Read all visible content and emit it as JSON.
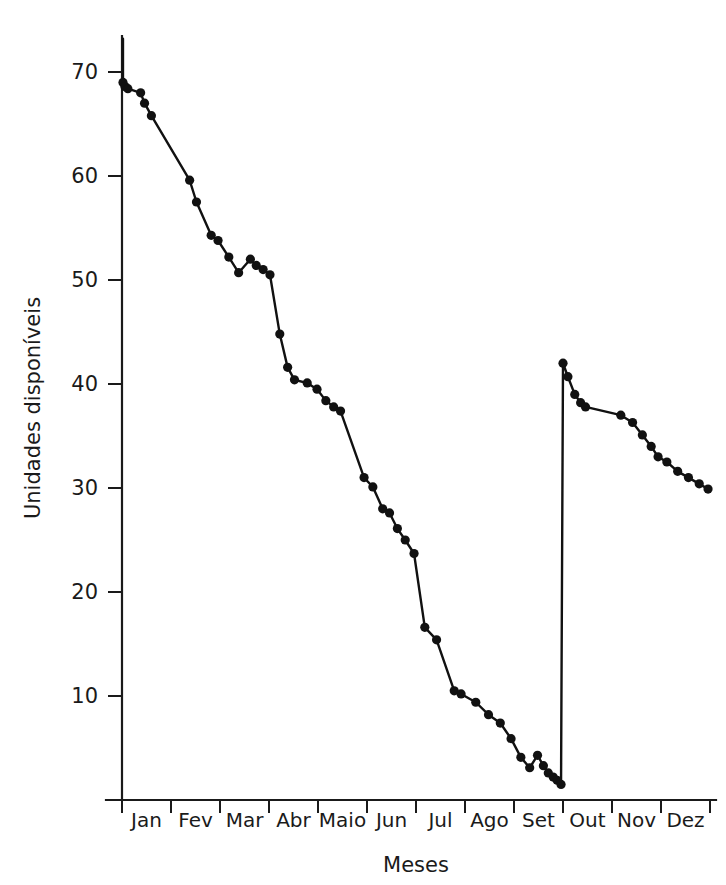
{
  "chart_data": {
    "type": "line",
    "title": "",
    "xlabel": "Meses",
    "ylabel": "Unidades disponíveis",
    "xtick_labels": [
      "Jan",
      "Fev",
      "Mar",
      "Abr",
      "Maio",
      "Jun",
      "Jul",
      "Ago",
      "Set",
      "Out",
      "Nov",
      "Dez"
    ],
    "ytick_labels": [
      "70",
      "60",
      "50",
      "40",
      "30",
      "20",
      "10"
    ],
    "ytick_values": [
      70,
      60,
      50,
      40,
      30,
      20,
      10
    ],
    "ylim": [
      0,
      73.5
    ],
    "xlim": [
      0,
      12
    ],
    "grid": false,
    "legend": "none",
    "marker": "filled-circle",
    "line_color": "#111111",
    "marker_color": "#111111",
    "background_color": "#ffffff",
    "annotations": [
      "Vertical restock jump at end of Set: value rises from about 1.5 to about 42",
      "Short vertical stub at start of Jan from about 73 down to about 69"
    ],
    "series": [
      {
        "name": "Unidades disponíveis",
        "x": [
          0.02,
          0.02,
          0.06,
          0.12,
          0.38,
          0.46,
          0.6,
          1.38,
          1.52,
          1.82,
          1.96,
          2.18,
          2.38,
          2.62,
          2.74,
          2.88,
          3.02,
          3.22,
          3.38,
          3.52,
          3.78,
          3.98,
          4.16,
          4.32,
          4.46,
          4.94,
          5.12,
          5.32,
          5.46,
          5.62,
          5.78,
          5.96,
          6.18,
          6.42,
          6.78,
          6.92,
          7.22,
          7.48,
          7.72,
          7.94,
          8.14,
          8.32,
          8.48,
          8.6,
          8.7,
          8.8,
          8.88,
          8.96,
          9.0,
          9.1,
          9.24,
          9.36,
          9.46,
          10.18,
          10.42,
          10.62,
          10.8,
          10.94,
          11.12,
          11.34,
          11.56,
          11.78,
          11.96
        ],
        "y": [
          73.2,
          69.0,
          68.6,
          68.4,
          68.0,
          67.0,
          65.8,
          59.6,
          57.5,
          54.3,
          53.8,
          52.2,
          50.7,
          52.0,
          51.4,
          51.0,
          50.5,
          44.8,
          41.6,
          40.4,
          40.1,
          39.5,
          38.4,
          37.8,
          37.4,
          31.0,
          30.1,
          28.0,
          27.6,
          26.1,
          25.0,
          23.7,
          16.6,
          15.4,
          10.5,
          10.2,
          9.4,
          8.2,
          7.4,
          5.9,
          4.1,
          3.1,
          4.3,
          3.3,
          2.6,
          2.2,
          1.9,
          1.5,
          42.0,
          40.7,
          39.0,
          38.2,
          37.8,
          37.0,
          36.3,
          35.1,
          34.0,
          33.0,
          32.5,
          31.6,
          31.0,
          30.4,
          29.9
        ]
      }
    ]
  }
}
